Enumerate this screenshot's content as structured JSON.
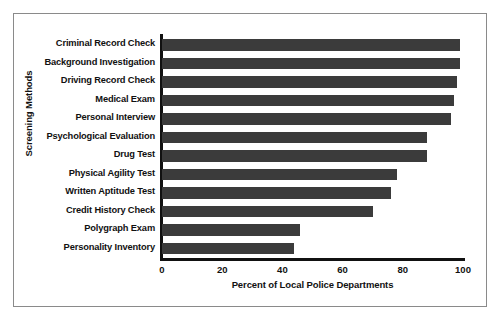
{
  "chart_data": {
    "type": "bar",
    "orientation": "horizontal",
    "title": "",
    "xlabel": "Percent of Local Police Departments",
    "ylabel": "Screening Methods",
    "categories": [
      "Criminal Record Check",
      "Background Investigation",
      "Driving Record Check",
      "Medical Exam",
      "Personal Interview",
      "Psychological Evaluation",
      "Drug Test",
      "Physical Agility Test",
      "Written Aptitude Test",
      "Credit History Check",
      "Polygraph Exam",
      "Personality Inventory"
    ],
    "values": [
      99,
      99,
      98,
      97,
      96,
      88,
      88,
      78,
      76,
      70,
      46,
      44
    ],
    "xlim": [
      0,
      100
    ],
    "xticks": [
      0,
      20,
      40,
      60,
      80,
      100
    ],
    "xtick_labels": [
      "0",
      "20",
      "40",
      "60",
      "80",
      "100"
    ],
    "grid": false,
    "legend": false,
    "bar_color": "#3b3b3b",
    "background_color": "#ffffff",
    "axis_color": "#111111",
    "frame_color": "#8a8a8a"
  }
}
